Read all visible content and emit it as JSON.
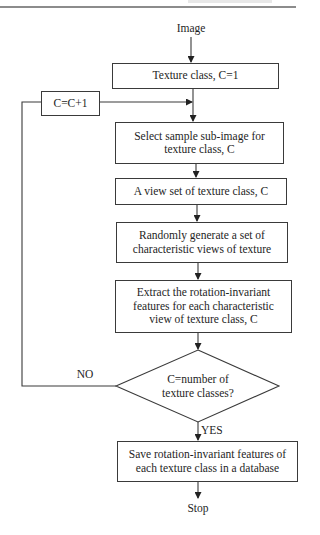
{
  "header": {
    "rule_color": "#8c8c8c"
  },
  "flowchart": {
    "start_label": "Image",
    "steps": [
      {
        "id": "init",
        "lines": [
          "Texture class, C=1"
        ]
      },
      {
        "id": "increment",
        "lines": [
          "C=C+1"
        ]
      },
      {
        "id": "select",
        "lines": [
          "Select sample sub-image for",
          "texture class, C"
        ]
      },
      {
        "id": "viewset",
        "lines": [
          "A view set of texture class, C"
        ]
      },
      {
        "id": "generate",
        "lines": [
          "Randomly generate a set of",
          "characteristic views of texture"
        ]
      },
      {
        "id": "extract",
        "lines": [
          "Extract the rotation-invariant",
          "features for each characteristic",
          "view of texture class, C"
        ]
      },
      {
        "id": "save",
        "lines": [
          "Save rotation-invariant features of",
          "each texture class in a database"
        ]
      }
    ],
    "decision": {
      "lines": [
        "C=number of",
        "texture classes?"
      ],
      "yes_label": "YES",
      "no_label": "NO"
    },
    "end_label": "Stop",
    "colors": {
      "stroke": "#3a3a3a",
      "text": "#1e1e1e",
      "background": "#ffffff"
    }
  }
}
